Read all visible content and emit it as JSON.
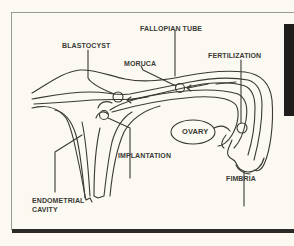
{
  "diagram": {
    "type": "anatomical",
    "labels": {
      "fallopian_tube": "FALLOPIAN TUBE",
      "blastocyst": "BLASTOCYST",
      "moruca": "MORUCA",
      "fertilization": "FERTILIZATION",
      "ovary": "OVARY",
      "implantation": "IMPLANTATION",
      "fimbria": "FIMBRIA",
      "endometrial_cavity_line1": "ENDOMETRIAL",
      "endometrial_cavity_line2": "CAVITY"
    },
    "colors": {
      "background": "#fbf9f1",
      "line": "#3a3936",
      "frame": "#9a9a96",
      "rule": "#2b2a28",
      "block": "#1f1e1c"
    }
  }
}
